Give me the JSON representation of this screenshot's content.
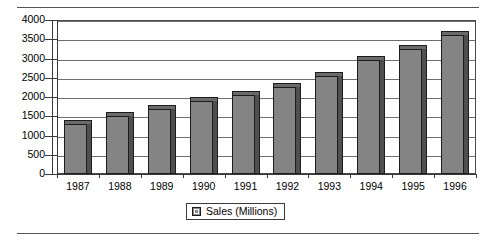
{
  "chart_data": {
    "type": "bar",
    "title": "",
    "subtitle": "",
    "xlabel": "",
    "ylabel": "",
    "categories": [
      "1987",
      "1988",
      "1989",
      "1990",
      "1991",
      "1992",
      "1993",
      "1994",
      "1995",
      "1996"
    ],
    "series": [
      {
        "name": "Sales (Millions)",
        "values": [
          1300,
          1500,
          1700,
          1900,
          2050,
          2250,
          2550,
          2950,
          3250,
          3600
        ],
        "color": "#848484"
      }
    ],
    "ylim": [
      0,
      4000
    ],
    "ytick_step": 500,
    "yticks": [
      0,
      500,
      1000,
      1500,
      2000,
      2500,
      3000,
      3500,
      4000
    ],
    "ytick_labels": [
      "0",
      "500",
      "1000",
      "1500",
      "2000",
      "2500",
      "3000",
      "3500",
      "4000"
    ],
    "grid": true,
    "grid_axis": "y",
    "legend": {
      "position": "bottom",
      "entries": [
        {
          "label": "Sales (Millions)",
          "swatch": "legend-swatch-icon"
        }
      ]
    },
    "style": "3d-column"
  },
  "figure": {
    "rule_top": "top-rule",
    "rule_bottom": "bottom-rule"
  }
}
